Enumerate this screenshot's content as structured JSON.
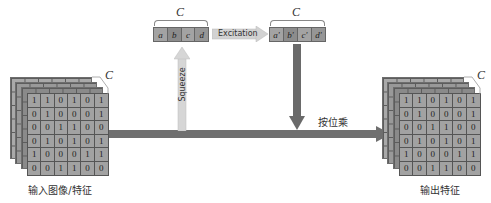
{
  "diagram": {
    "input": {
      "caption": "输入图像/特征",
      "channel_label": "C",
      "matrix": [
        [
          "1",
          "1",
          "0",
          "1",
          "0",
          "1"
        ],
        [
          "0",
          "1",
          "0",
          "0",
          "0",
          "1"
        ],
        [
          "0",
          "0",
          "1",
          "1",
          "0",
          "0"
        ],
        [
          "0",
          "1",
          "0",
          "1",
          "0",
          "1"
        ],
        [
          "1",
          "0",
          "0",
          "0",
          "1",
          "1"
        ],
        [
          "0",
          "0",
          "1",
          "1",
          "0",
          "0"
        ]
      ]
    },
    "output": {
      "caption": "输出特征",
      "channel_label": "C",
      "matrix": [
        [
          "1",
          "1",
          "0",
          "1",
          "0",
          "1"
        ],
        [
          "0",
          "1",
          "0",
          "0",
          "0",
          "1"
        ],
        [
          "0",
          "0",
          "1",
          "1",
          "0",
          "0"
        ],
        [
          "0",
          "1",
          "0",
          "1",
          "0",
          "1"
        ],
        [
          "1",
          "0",
          "0",
          "0",
          "1",
          "1"
        ],
        [
          "0",
          "0",
          "1",
          "1",
          "0",
          "0"
        ]
      ]
    },
    "squeeze_vector": {
      "channel_label": "C",
      "cells": [
        "a",
        "b",
        "c",
        "d"
      ],
      "colors": [
        "#a3a3a3",
        "#8c8c8c",
        "#a3a3a3",
        "#969696"
      ]
    },
    "excitation_vector": {
      "channel_label": "C",
      "cells": [
        "a'",
        "b'",
        "c'",
        "d'"
      ],
      "colors": [
        "#a3a3a3",
        "#8c8c8c",
        "#a3a3a3",
        "#969696"
      ]
    },
    "arrows": {
      "squeeze": "Squeeze",
      "excitation": "Excitation",
      "multiply": "按位乘"
    },
    "colors": {
      "main_arrow": "#6f6f6f",
      "squeeze_arrow": "#d8d8d8",
      "scale_arrow": "#6a6a6a",
      "excitation_arrow": "#cfcfcf"
    }
  }
}
